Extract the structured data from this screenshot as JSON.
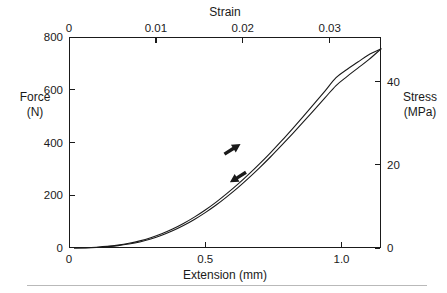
{
  "chart_data": {
    "type": "line",
    "title": "",
    "xlabel": "Extension (mm)",
    "ylabel": "Force\n(N)",
    "x2label": "Strain",
    "y2label": "Stress\n(MPa)",
    "xlim": [
      0,
      1.145
    ],
    "ylim": [
      0,
      800
    ],
    "x2lim": [
      0,
      0.0359
    ],
    "y2lim": [
      0,
      50.7
    ],
    "grid": false,
    "legend": null,
    "xticks": [
      0,
      0.5,
      1.0
    ],
    "xticklabels": [
      "0",
      "0.5",
      "1.0"
    ],
    "yticks": [
      0,
      200,
      400,
      600,
      800
    ],
    "yticklabels": [
      "0",
      "200",
      "400",
      "600",
      "800"
    ],
    "x2ticks": [
      0,
      0.01,
      0.02,
      0.03
    ],
    "x2ticklabels": [
      "0",
      "0.01",
      "0.02",
      "0.03"
    ],
    "y2ticks": [
      0,
      20,
      40
    ],
    "y2ticklabels": [
      "0",
      "20",
      "40"
    ],
    "series": [
      {
        "name": "loading",
        "direction": "up-right",
        "points": [
          [
            0.02,
            0
          ],
          [
            0.06,
            1
          ],
          [
            0.1,
            3
          ],
          [
            0.14,
            6
          ],
          [
            0.18,
            11
          ],
          [
            0.22,
            18
          ],
          [
            0.26,
            27
          ],
          [
            0.3,
            39
          ],
          [
            0.34,
            54
          ],
          [
            0.38,
            72
          ],
          [
            0.42,
            93
          ],
          [
            0.46,
            117
          ],
          [
            0.5,
            144
          ],
          [
            0.54,
            174
          ],
          [
            0.58,
            207
          ],
          [
            0.62,
            242
          ],
          [
            0.66,
            280
          ],
          [
            0.7,
            320
          ],
          [
            0.74,
            362
          ],
          [
            0.78,
            406
          ],
          [
            0.82,
            452
          ],
          [
            0.86,
            499
          ],
          [
            0.9,
            547
          ],
          [
            0.94,
            596
          ],
          [
            0.98,
            646
          ],
          [
            1.02,
            677
          ],
          [
            1.06,
            705
          ],
          [
            1.1,
            733
          ],
          [
            1.145,
            755
          ]
        ]
      },
      {
        "name": "unloading",
        "direction": "down-left",
        "points": [
          [
            1.145,
            755
          ],
          [
            1.1,
            714
          ],
          [
            1.06,
            682
          ],
          [
            1.02,
            650
          ],
          [
            0.98,
            616
          ],
          [
            0.94,
            570
          ],
          [
            0.9,
            524
          ],
          [
            0.86,
            478
          ],
          [
            0.82,
            433
          ],
          [
            0.78,
            389
          ],
          [
            0.74,
            346
          ],
          [
            0.7,
            305
          ],
          [
            0.66,
            266
          ],
          [
            0.62,
            229
          ],
          [
            0.58,
            195
          ],
          [
            0.54,
            163
          ],
          [
            0.5,
            134
          ],
          [
            0.46,
            108
          ],
          [
            0.42,
            85
          ],
          [
            0.38,
            65
          ],
          [
            0.34,
            48
          ],
          [
            0.3,
            34
          ],
          [
            0.26,
            23
          ],
          [
            0.22,
            15
          ],
          [
            0.18,
            9
          ],
          [
            0.14,
            5
          ],
          [
            0.1,
            2
          ],
          [
            0.06,
            0.5
          ],
          [
            0.02,
            0
          ]
        ]
      }
    ],
    "annotations": [
      {
        "name": "loading-arrow",
        "label": "",
        "x": 0.6,
        "y": 375,
        "direction": "up-right"
      },
      {
        "name": "unloading-arrow",
        "label": "",
        "x": 0.62,
        "y": 268,
        "direction": "down-left"
      }
    ]
  },
  "axes": {
    "left": {
      "title_line1": "Force",
      "title_line2": "(N)",
      "ticks": [
        {
          "label": "800",
          "value": 800
        },
        {
          "label": "600",
          "value": 600
        },
        {
          "label": "400",
          "value": 400
        },
        {
          "label": "200",
          "value": 200
        },
        {
          "label": "0",
          "value": 0
        }
      ]
    },
    "right": {
      "title_line1": "Stress",
      "title_line2": "(MPa)",
      "ticks": [
        {
          "label": "40",
          "value": 40
        },
        {
          "label": "20",
          "value": 20
        },
        {
          "label": "0",
          "value": 0
        }
      ]
    },
    "top": {
      "title": "Strain",
      "ticks": [
        {
          "label": "0",
          "value": 0
        },
        {
          "label": "0.01",
          "value": 0.01
        },
        {
          "label": "0.02",
          "value": 0.02
        },
        {
          "label": "0.03",
          "value": 0.03
        }
      ]
    },
    "bottom": {
      "title": "Extension (mm)",
      "ticks": [
        {
          "label": "0",
          "value": 0
        },
        {
          "label": "0.5",
          "value": 0.5
        },
        {
          "label": "1.0",
          "value": 1.0
        }
      ]
    }
  },
  "style": {
    "curve_color": "#1a1a1a",
    "axis_color": "#1a1a1a",
    "background": "#ffffff",
    "rule_color": "#b9b9b9"
  }
}
